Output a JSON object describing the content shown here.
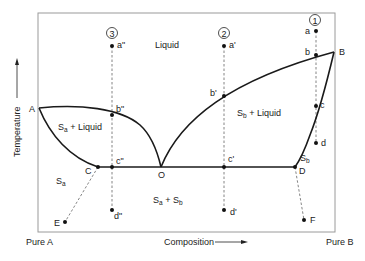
{
  "diagram": {
    "axes": {
      "x_label": "Composition",
      "y_label": "Temperature",
      "left_end": "Pure A",
      "right_end": "Pure B"
    },
    "regions": {
      "liquid": "Liquid",
      "sa_liquid_main": "S",
      "sa_liquid_sub": "a",
      "sa_liquid_rest": " + Liquid",
      "sb_liquid_main": "S",
      "sb_liquid_sub": "b",
      "sb_liquid_rest": " + Liquid",
      "sa_main": "S",
      "sa_sub": "a",
      "sb_main": "S",
      "sb_sub": "b",
      "sasb_1": "S",
      "sasb_1_sub": "a",
      "sasb_plus": " + S",
      "sasb_2_sub": "b"
    },
    "points": {
      "A": "A",
      "B": "B",
      "C": "C",
      "D": "D",
      "E": "E",
      "F": "F",
      "O": "O",
      "a": "a",
      "b": "b",
      "c": "c",
      "d": "d",
      "a1": "a'",
      "b1": "b'",
      "c1": "c'",
      "d1": "d'",
      "a2": "a\"",
      "b2": "b\"",
      "c2": "c\"",
      "d2": "d\""
    },
    "paths": {
      "path1": "1",
      "path2": "2",
      "path3": "3"
    },
    "colors": {
      "line": "#1a1a1a",
      "frame": "#9a9a9a",
      "dashed": "#666666"
    }
  }
}
